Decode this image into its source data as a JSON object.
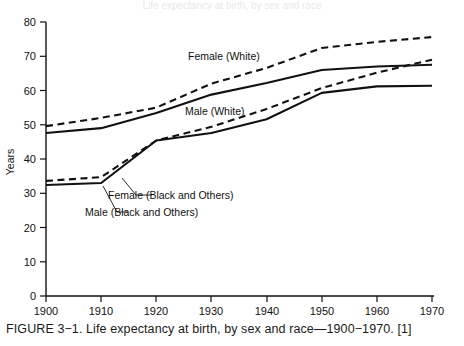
{
  "figure": {
    "caption": "FIGURE 3−1. Life expectancy at birth, by sex and race—1900−1970. [1]",
    "top_partial_text": "Life expectancy at birth, by sex and race"
  },
  "axes": {
    "ylabel": "Years",
    "y_ticks": [
      "0",
      "10",
      "20",
      "30",
      "40",
      "50",
      "60",
      "70",
      "80"
    ],
    "x_ticks": [
      "1900",
      "1910",
      "1920",
      "1930",
      "1940",
      "1950",
      "1960",
      "1970"
    ]
  },
  "annotations": [
    {
      "name": "female-white",
      "text": "Female (White)"
    },
    {
      "name": "male-white",
      "text": "Male (White)"
    },
    {
      "name": "female-black-others",
      "text": "Female (Black and Others)"
    },
    {
      "name": "male-black-others",
      "text": "Male (Black and Others)"
    }
  ],
  "colors": {
    "ink": "#111111",
    "background": "#ffffff"
  },
  "chart_data": {
    "type": "line",
    "title": "Life expectancy at birth, by sex and race—1900−1970",
    "xlabel": "",
    "ylabel": "Years",
    "xlim": [
      1900,
      1970
    ],
    "ylim": [
      0,
      80
    ],
    "grid": false,
    "legend": "inline-annotations",
    "x": [
      1900,
      1910,
      1920,
      1930,
      1940,
      1950,
      1960,
      1970
    ],
    "series": [
      {
        "name": "Female (White)",
        "style": "dashed",
        "values": [
          49.6,
          52.0,
          55.0,
          62.0,
          66.6,
          72.4,
          74.2,
          75.6
        ]
      },
      {
        "name": "Male (White)",
        "style": "solid",
        "values": [
          47.6,
          49.0,
          53.4,
          58.8,
          62.2,
          66.0,
          67.0,
          67.5
        ]
      },
      {
        "name": "Female (Black and Others)",
        "style": "dashed",
        "values": [
          33.6,
          34.7,
          45.4,
          49.4,
          54.6,
          60.7,
          65.2,
          69.0
        ]
      },
      {
        "name": "Male (Black and Others)",
        "style": "solid",
        "values": [
          32.4,
          33.0,
          45.4,
          47.6,
          51.6,
          59.3,
          61.2,
          61.4
        ]
      }
    ]
  }
}
